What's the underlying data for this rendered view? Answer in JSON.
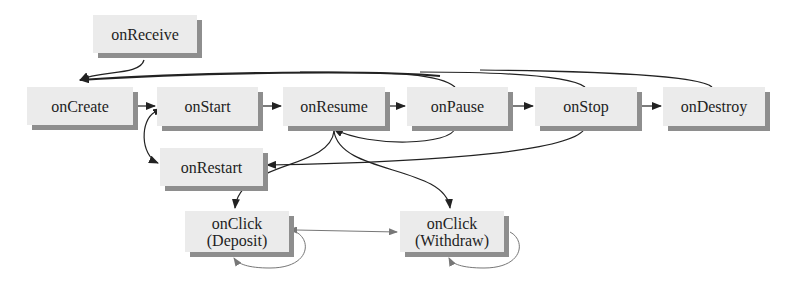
{
  "diagram": {
    "type": "state-flow",
    "nodes": {
      "onReceive": {
        "label": "onReceive"
      },
      "onCreate": {
        "label": "onCreate"
      },
      "onStart": {
        "label": "onStart"
      },
      "onResume": {
        "label": "onResume"
      },
      "onPause": {
        "label": "onPause"
      },
      "onStop": {
        "label": "onStop"
      },
      "onDestroy": {
        "label": "onDestroy"
      },
      "onRestart": {
        "label": "onRestart"
      },
      "onClickDeposit": {
        "line1": "onClick",
        "line2": "(Deposit)"
      },
      "onClickWithdraw": {
        "line1": "onClick",
        "line2": "(Withdraw)"
      }
    },
    "edges": [
      {
        "from": "onReceive",
        "to": "onCreate"
      },
      {
        "from": "onCreate",
        "to": "onStart"
      },
      {
        "from": "onStart",
        "to": "onResume"
      },
      {
        "from": "onResume",
        "to": "onPause"
      },
      {
        "from": "onPause",
        "to": "onStop"
      },
      {
        "from": "onStop",
        "to": "onDestroy"
      },
      {
        "from": "onPause",
        "to": "onCreate"
      },
      {
        "from": "onStop",
        "to": "onCreate"
      },
      {
        "from": "onDestroy",
        "to": "onCreate"
      },
      {
        "from": "onResume",
        "to": "onCreate"
      },
      {
        "from": "onPause",
        "to": "onResume"
      },
      {
        "from": "onStop",
        "to": "onRestart"
      },
      {
        "from": "onStart",
        "to": "onRestart",
        "bidirectional": true
      },
      {
        "from": "onResume",
        "to": "onClickDeposit"
      },
      {
        "from": "onResume",
        "to": "onClickWithdraw"
      },
      {
        "from": "onClickDeposit",
        "to": "onClickWithdraw",
        "bidirectional": true
      },
      {
        "from": "onClickDeposit",
        "to": "onClickDeposit"
      },
      {
        "from": "onClickWithdraw",
        "to": "onClickWithdraw"
      }
    ],
    "colors": {
      "node_fill": "#ebebeb",
      "node_shadow": "#8e8e8e",
      "edge_dark": "#222222",
      "edge_light": "#6a6a6a"
    }
  }
}
